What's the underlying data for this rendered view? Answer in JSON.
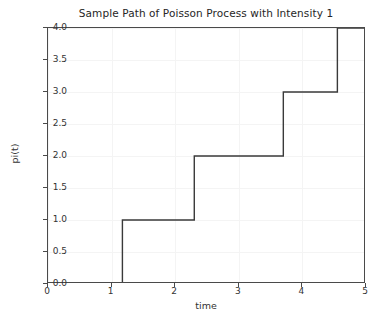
{
  "chart_data": {
    "type": "line",
    "subtype": "step-post",
    "title": "Sample Path of Poisson Process with Intensity 1",
    "xlabel": "time",
    "ylabel": "pi(t)",
    "xlim": [
      0,
      5
    ],
    "ylim": [
      0.0,
      4.0
    ],
    "xticks": [
      0,
      1,
      2,
      3,
      4,
      5
    ],
    "xticklabels": [
      "0",
      "1",
      "2",
      "3",
      "4",
      "5"
    ],
    "yticks": [
      0.0,
      0.5,
      1.0,
      1.5,
      2.0,
      2.5,
      3.0,
      3.5,
      4.0
    ],
    "yticklabels": [
      "0.0",
      "0.5",
      "1.0",
      "1.5",
      "2.0",
      "2.5",
      "3.0",
      "3.5",
      "4.0"
    ],
    "grid": true,
    "legend": null,
    "jump_times": [
      1.17,
      2.3,
      3.7,
      4.55
    ],
    "x": [
      0,
      1.17,
      1.17,
      2.3,
      2.3,
      3.7,
      3.7,
      4.55,
      4.55,
      5
    ],
    "y": [
      0,
      0,
      1,
      1,
      2,
      2,
      3,
      3,
      4,
      4
    ],
    "series": [
      {
        "name": "pi(t)",
        "x": [
          0,
          1.17,
          1.17,
          2.3,
          2.3,
          3.7,
          3.7,
          4.55,
          4.55,
          5
        ],
        "values": [
          0,
          0,
          1,
          1,
          2,
          2,
          3,
          3,
          4,
          4
        ],
        "color": "#3a3a3a",
        "linewidth": 1.4
      }
    ],
    "colors": {
      "line": "#3a3a3a",
      "axis": "#4a4a4a",
      "grid": "#f4f4f4",
      "text": "#333333",
      "title": "#262626",
      "background": "#ffffff"
    }
  }
}
